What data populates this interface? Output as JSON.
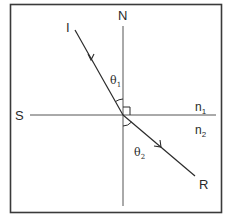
{
  "diagram": {
    "labels": {
      "normal": "N",
      "surface": "S",
      "incident": "I",
      "refracted": "R",
      "theta1": "θ",
      "theta1_sub": "1",
      "theta2": "θ",
      "theta2_sub": "2",
      "n1": "n",
      "n1_sub": "1",
      "n2": "n",
      "n2_sub": "2"
    },
    "colors": {
      "frame": "#3a3a3a",
      "lines": "#555555",
      "rays": "#2a2a2a",
      "background": "#ffffff"
    }
  }
}
